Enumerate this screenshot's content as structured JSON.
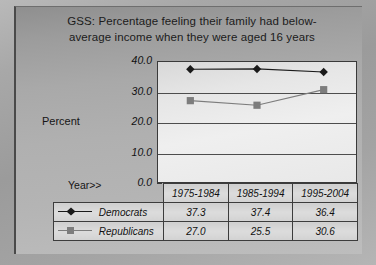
{
  "chart_data": {
    "type": "line",
    "title_lines": [
      "GSS:  Percentage feeling their family had below-",
      "average income when they were aged 16 years"
    ],
    "xlabel": "Year>>",
    "ylabel": "Percent",
    "categories": [
      "1975-1984",
      "1985-1994",
      "1995-2004"
    ],
    "ylim": [
      0.0,
      40.0
    ],
    "yticks": [
      "40.0",
      "30.0",
      "20.0",
      "10.0",
      "0.0"
    ],
    "ytick_values": [
      40.0,
      30.0,
      20.0,
      10.0,
      0.0
    ],
    "grid": true,
    "legend_position": "table",
    "series": [
      {
        "name": "Democrats",
        "values": [
          37.3,
          37.4,
          36.4
        ],
        "labels": [
          "37.3",
          "37.4",
          "36.4"
        ],
        "marker": "diamond",
        "color": "#1a1a1a"
      },
      {
        "name": "Republicans",
        "values": [
          27.0,
          25.5,
          30.6
        ],
        "labels": [
          "27.0",
          "25.5",
          "30.6"
        ],
        "marker": "square",
        "color": "#7d7d7d"
      }
    ]
  },
  "colors": {
    "democrats": "#1a1a1a",
    "republicans": "#7d7d7d",
    "frame": "#3a3a3a",
    "gridline": "#4d4d4d",
    "background": "#a8a8a8"
  }
}
